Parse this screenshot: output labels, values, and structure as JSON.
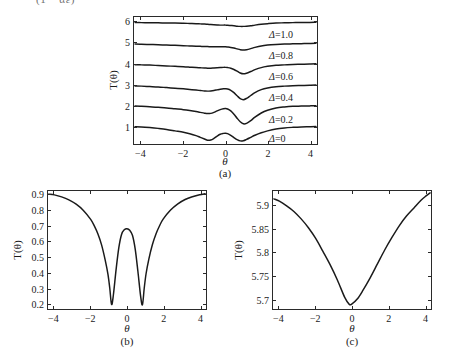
{
  "figure": {
    "top_fragment": "(1 − αε)",
    "background": "#ffffff",
    "curve_color": "#1a1a1a",
    "axis_color": "#2a2a2a"
  },
  "panels": [
    {
      "id": "a",
      "caption": "(a)",
      "xlabel": "θ",
      "ylabel": "T(θ)",
      "xticks": [
        "−4",
        "−2",
        "0",
        "2",
        "4"
      ],
      "xtick_values": [
        -4,
        -2,
        0,
        2,
        4
      ],
      "yticks": [
        "1",
        "2",
        "3",
        "4",
        "5",
        "6"
      ],
      "ytick_values": [
        1,
        2,
        3,
        4,
        5,
        6
      ],
      "annotations": [
        {
          "label": "Δ=1.0",
          "x": 2.05,
          "y": 5.35
        },
        {
          "label": "Δ=0.8",
          "x": 2.05,
          "y": 4.35
        },
        {
          "label": "Δ=0.6",
          "x": 2.05,
          "y": 3.35
        },
        {
          "label": "Δ=0.4",
          "x": 2.05,
          "y": 2.35
        },
        {
          "label": "Δ=0.2",
          "x": 2.05,
          "y": 1.35
        },
        {
          "label": "Δ=0",
          "x": 2.05,
          "y": 0.45
        }
      ]
    },
    {
      "id": "b",
      "caption": "(b)",
      "xlabel": "θ",
      "ylabel": "T(θ)",
      "xticks": [
        "−4",
        "−2",
        "0",
        "2",
        "4"
      ],
      "xtick_values": [
        -4,
        -2,
        0,
        2,
        4
      ],
      "yticks": [
        "0.2",
        "0.3",
        "0.4",
        "0.5",
        "0.6",
        "0.7",
        "0.8",
        "0.9"
      ],
      "ytick_values": [
        0.2,
        0.3,
        0.4,
        0.5,
        0.6,
        0.7,
        0.8,
        0.9
      ]
    },
    {
      "id": "c",
      "caption": "(c)",
      "xlabel": "θ",
      "ylabel": "T(θ)",
      "xticks": [
        "−4",
        "−2",
        "0",
        "2",
        "4"
      ],
      "xtick_values": [
        -4,
        -2,
        0,
        2,
        4
      ],
      "yticks": [
        "5.7",
        "5.75",
        "5.8",
        "5.85",
        "5.9"
      ],
      "ytick_values": [
        5.7,
        5.75,
        5.8,
        5.85,
        5.9
      ]
    }
  ],
  "chart_data": [
    {
      "type": "line",
      "panel": "a",
      "title": "",
      "xlabel": "θ",
      "ylabel": "T(θ)",
      "xlim": [
        -4.35,
        4.35
      ],
      "ylim": [
        0.15,
        6.25
      ],
      "grid": false,
      "legend": "inline-annotations",
      "note": "Six vertically offset transmission curves T(theta); offset = index, each curve shows a dip near theta=0 that deepens and splits into a double-dip (W shape) as Delta decreases to 0.",
      "x": [
        -4.3,
        -4.0,
        -3.6,
        -3.2,
        -2.8,
        -2.4,
        -2.0,
        -1.7,
        -1.4,
        -1.2,
        -1.0,
        -0.85,
        -0.7,
        -0.55,
        -0.4,
        -0.25,
        -0.1,
        0,
        0.1,
        0.25,
        0.4,
        0.55,
        0.7,
        0.85,
        1.0,
        1.2,
        1.4,
        1.7,
        2.0,
        2.4,
        2.8,
        3.2,
        3.6,
        4.0,
        4.3
      ],
      "series": [
        {
          "name": "Δ=0",
          "offset": 0,
          "values": [
            0.98,
            0.97,
            0.94,
            0.9,
            0.85,
            0.78,
            0.71,
            0.64,
            0.55,
            0.47,
            0.39,
            0.33,
            0.34,
            0.42,
            0.53,
            0.62,
            0.66,
            0.67,
            0.65,
            0.57,
            0.46,
            0.36,
            0.3,
            0.31,
            0.37,
            0.47,
            0.57,
            0.69,
            0.78,
            0.87,
            0.92,
            0.95,
            0.97,
            0.98,
            0.99
          ]
        },
        {
          "name": "Δ=0.2",
          "offset": 1,
          "values": [
            1.97,
            1.96,
            1.94,
            1.91,
            1.88,
            1.84,
            1.8,
            1.76,
            1.71,
            1.67,
            1.63,
            1.61,
            1.62,
            1.67,
            1.74,
            1.8,
            1.84,
            1.85,
            1.83,
            1.74,
            1.58,
            1.39,
            1.22,
            1.12,
            1.14,
            1.27,
            1.44,
            1.64,
            1.77,
            1.88,
            1.93,
            1.96,
            1.97,
            1.98,
            1.99
          ]
        },
        {
          "name": "Δ=0.4",
          "offset": 2,
          "values": [
            2.94,
            2.93,
            2.91,
            2.89,
            2.86,
            2.83,
            2.8,
            2.77,
            2.74,
            2.72,
            2.7,
            2.69,
            2.7,
            2.72,
            2.75,
            2.78,
            2.8,
            2.8,
            2.79,
            2.73,
            2.62,
            2.47,
            2.33,
            2.28,
            2.34,
            2.48,
            2.62,
            2.76,
            2.84,
            2.9,
            2.93,
            2.95,
            2.96,
            2.97,
            2.98
          ]
        },
        {
          "name": "Δ=0.6",
          "offset": 3,
          "values": [
            3.96,
            3.95,
            3.94,
            3.92,
            3.9,
            3.88,
            3.86,
            3.84,
            3.82,
            3.81,
            3.8,
            3.79,
            3.79,
            3.8,
            3.81,
            3.82,
            3.83,
            3.83,
            3.82,
            3.79,
            3.73,
            3.65,
            3.56,
            3.52,
            3.55,
            3.63,
            3.72,
            3.82,
            3.88,
            3.93,
            3.95,
            3.97,
            3.98,
            3.99,
            4.0
          ]
        },
        {
          "name": "Δ=0.8",
          "offset": 4,
          "values": [
            4.95,
            4.94,
            4.93,
            4.92,
            4.9,
            4.89,
            4.87,
            4.86,
            4.85,
            4.84,
            4.83,
            4.83,
            4.82,
            4.82,
            4.82,
            4.82,
            4.82,
            4.82,
            4.81,
            4.79,
            4.76,
            4.72,
            4.68,
            4.66,
            4.68,
            4.73,
            4.79,
            4.86,
            4.9,
            4.93,
            4.95,
            4.96,
            4.97,
            4.98,
            4.99
          ]
        },
        {
          "name": "Δ=1.0",
          "offset": 5,
          "values": [
            5.98,
            5.98,
            5.97,
            5.97,
            5.96,
            5.96,
            5.95,
            5.94,
            5.93,
            5.92,
            5.91,
            5.9,
            5.89,
            5.88,
            5.87,
            5.86,
            5.86,
            5.86,
            5.85,
            5.84,
            5.83,
            5.81,
            5.8,
            5.8,
            5.81,
            5.83,
            5.86,
            5.9,
            5.93,
            5.96,
            5.97,
            5.98,
            5.99,
            5.99,
            6.0
          ]
        }
      ]
    },
    {
      "type": "line",
      "panel": "b",
      "title": "",
      "xlabel": "θ",
      "ylabel": "T(θ)",
      "xlim": [
        -4.35,
        4.35
      ],
      "ylim": [
        0.165,
        0.925
      ],
      "grid": false,
      "note": "W-shaped transmission curve: two deep minima near theta = ±0.85 at T ≈ 0.19, a central local maximum at theta = 0 of T ≈ 0.68, rising to T ≈ 0.90 at the edges.",
      "x": [
        -4.3,
        -4.0,
        -3.6,
        -3.2,
        -2.8,
        -2.4,
        -2.0,
        -1.8,
        -1.6,
        -1.4,
        -1.2,
        -1.05,
        -0.95,
        -0.85,
        -0.75,
        -0.6,
        -0.45,
        -0.3,
        -0.15,
        0,
        0.15,
        0.3,
        0.45,
        0.6,
        0.75,
        0.85,
        0.95,
        1.05,
        1.2,
        1.4,
        1.6,
        1.8,
        2.0,
        2.4,
        2.8,
        3.2,
        3.6,
        4.0,
        4.3
      ],
      "values": [
        0.905,
        0.9,
        0.887,
        0.868,
        0.84,
        0.8,
        0.742,
        0.7,
        0.648,
        0.578,
        0.48,
        0.39,
        0.3,
        0.195,
        0.255,
        0.42,
        0.56,
        0.645,
        0.675,
        0.682,
        0.672,
        0.64,
        0.552,
        0.408,
        0.248,
        0.192,
        0.3,
        0.392,
        0.485,
        0.58,
        0.65,
        0.703,
        0.745,
        0.802,
        0.842,
        0.87,
        0.888,
        0.901,
        0.907
      ]
    },
    {
      "type": "line",
      "panel": "c",
      "title": "",
      "xlabel": "θ",
      "ylabel": "T(θ)",
      "xlim": [
        -4.35,
        4.35
      ],
      "ylim": [
        5.678,
        5.932
      ],
      "grid": false,
      "note": "Single broad V-shaped minimum centred near theta ≈ −0.15 with T ≈ 5.687, rising to about T ≈ 5.915 at theta = −4.3 and T ≈ 5.928 at theta = 4.3.",
      "x": [
        -4.3,
        -4.0,
        -3.6,
        -3.2,
        -2.8,
        -2.4,
        -2.0,
        -1.6,
        -1.2,
        -0.8,
        -0.4,
        -0.15,
        0,
        0.3,
        0.6,
        1.0,
        1.4,
        1.8,
        2.2,
        2.6,
        3.0,
        3.4,
        3.8,
        4.1,
        4.3
      ],
      "values": [
        5.915,
        5.91,
        5.9,
        5.888,
        5.872,
        5.853,
        5.83,
        5.802,
        5.773,
        5.74,
        5.703,
        5.688,
        5.689,
        5.7,
        5.718,
        5.745,
        5.775,
        5.805,
        5.832,
        5.857,
        5.878,
        5.895,
        5.912,
        5.922,
        5.928
      ]
    }
  ]
}
